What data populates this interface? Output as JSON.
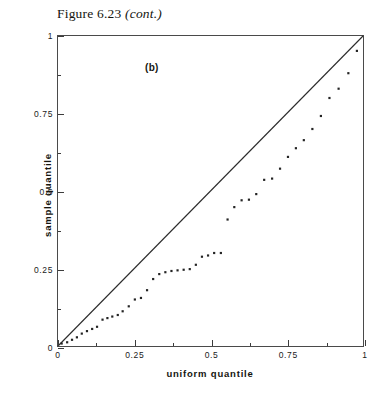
{
  "caption": {
    "prefix": "Figure 6.23",
    "cont": "(cont.)"
  },
  "panel": {
    "label": "(b)"
  },
  "chart_data": {
    "type": "scatter",
    "title": "Figure 6.23 (cont.)",
    "subtitle": "(b)",
    "xlabel": "uniform quantile",
    "ylabel": "sample quantile",
    "xlim": [
      0,
      1
    ],
    "ylim": [
      0,
      1
    ],
    "xticks": [
      0,
      0.25,
      0.5,
      0.75,
      1
    ],
    "xticklabels": [
      "0",
      "0.25",
      "0.5",
      "0.75",
      "1"
    ],
    "yticks": [
      0,
      0.25,
      0.5,
      0.75,
      1
    ],
    "yticklabels": [
      "0",
      "0.25",
      "0.5",
      "0.75",
      "1"
    ],
    "minor_xticks": [
      0.125,
      0.375,
      0.625,
      0.875
    ],
    "minor_yticks": [
      0.125,
      0.375,
      0.625,
      0.875
    ],
    "grid": false,
    "legend": null,
    "reference_line": {
      "name": "identity-line",
      "from": [
        0,
        0
      ],
      "to": [
        1,
        1
      ],
      "style": "solid"
    },
    "series": [
      {
        "name": "sample quantiles",
        "marker": "dot",
        "x": [
          0.012,
          0.03,
          0.046,
          0.062,
          0.078,
          0.095,
          0.112,
          0.128,
          0.146,
          0.162,
          0.178,
          0.196,
          0.212,
          0.232,
          0.252,
          0.272,
          0.292,
          0.312,
          0.332,
          0.352,
          0.372,
          0.392,
          0.412,
          0.432,
          0.452,
          0.472,
          0.492,
          0.512,
          0.534,
          0.556,
          0.578,
          0.602,
          0.626,
          0.65,
          0.676,
          0.702,
          0.728,
          0.754,
          0.78,
          0.806,
          0.834,
          0.862,
          0.89,
          0.92,
          0.952,
          0.98
        ],
        "y": [
          0.008,
          0.012,
          0.02,
          0.028,
          0.04,
          0.048,
          0.055,
          0.062,
          0.085,
          0.09,
          0.095,
          0.1,
          0.112,
          0.128,
          0.15,
          0.155,
          0.18,
          0.216,
          0.232,
          0.238,
          0.242,
          0.244,
          0.246,
          0.248,
          0.262,
          0.288,
          0.292,
          0.3,
          0.3,
          0.408,
          0.448,
          0.47,
          0.472,
          0.49,
          0.536,
          0.54,
          0.572,
          0.61,
          0.638,
          0.664,
          0.7,
          0.742,
          0.8,
          0.83,
          0.88,
          0.952
        ]
      }
    ]
  }
}
